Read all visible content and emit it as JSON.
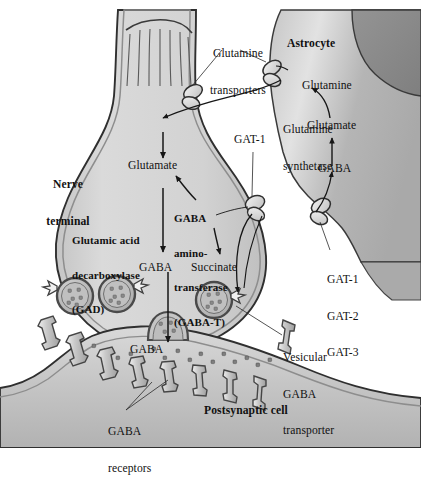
{
  "figure": {
    "domain": "biological-diagram",
    "canvas": {
      "width": 421,
      "height": 448
    },
    "palette": {
      "background": "#ffffff",
      "outline": "#2b2b2b",
      "terminal_fill": "#d4d4d4",
      "terminal_membrane": "#9a9a9a",
      "astrocyte_fill": "#b4b4b4",
      "astrocyte_nucleus": "#8e8e8e",
      "postsynaptic_fill": "#c9c9c9",
      "vesicle_fill": "#b9b9b9",
      "receptor_fill": "#d8d8d8",
      "transporter_fill": "#e3e3e3",
      "cleft_fill": "#c0c0c0",
      "text": "#111111"
    }
  },
  "labels": {
    "glutamine_transporters": {
      "line1": "Glutamine",
      "line2": "transporters"
    },
    "astrocyte": "Astrocyte",
    "nerve_terminal": {
      "line1": "Nerve",
      "line2": "terminal"
    },
    "glutamate_terminal": "Glutamate",
    "glutamine_astro": "Glutamine",
    "glutamine_synthetase": {
      "line1": "Glutamine",
      "line2": "synthetase"
    },
    "glutamate_astro": "Glutamate",
    "gaba_astro": "GABA",
    "gat1_cleft": "GAT-1",
    "gad": {
      "line1": "Glutamic acid",
      "line2": "decarboxylase",
      "line3": "(GAD)"
    },
    "gaba_t": {
      "line1": "GABA",
      "line2": "amino-",
      "line3": "transferase",
      "line4": "(GABA-T)"
    },
    "gaba_cytosol": "GABA",
    "succinate": "Succinate",
    "gaba_cleft": "GABA",
    "gat_family": {
      "line1": "GAT-1",
      "line2": "GAT-2",
      "line3": "GAT-3"
    },
    "vesicular_gaba_transporter": {
      "line1": "Vesicular",
      "line2": "GABA",
      "line3": "transporter"
    },
    "gaba_receptors": {
      "line1": "GABA",
      "line2": "receptors"
    },
    "postsynaptic_cell": "Postsynaptic cell"
  },
  "structures": [
    {
      "name": "presynaptic-nerve-terminal",
      "description": "Large bulbous axon terminal, light grey, striated cytoskeleton at top"
    },
    {
      "name": "astrocyte",
      "description": "Mid-grey glial cell at upper right with darker nucleus"
    },
    {
      "name": "postsynaptic-cell",
      "description": "Grey cell below the terminal bearing GABA receptors"
    },
    {
      "name": "synaptic-cleft",
      "description": "Narrow space containing released GABA molecules"
    },
    {
      "name": "synaptic-vesicles",
      "count": 4,
      "description": "Round vesicles filled with GABA; one is fused to the membrane"
    },
    {
      "name": "glutamine-transporter-astrocyte",
      "count": 1
    },
    {
      "name": "glutamine-transporter-terminal",
      "count": 1
    },
    {
      "name": "gat1-transporter-terminal",
      "count": 1
    },
    {
      "name": "gat-transporter-astrocyte",
      "count": 1
    },
    {
      "name": "vesicular-gaba-transporters",
      "count": 4
    },
    {
      "name": "gaba-receptors",
      "count": 9
    }
  ],
  "pathways": [
    {
      "from": "Glutamine (astrocyte)",
      "to": "Glutamine transporters",
      "to2": "Nerve terminal"
    },
    {
      "from": "Glutamine",
      "to": "Glutamate",
      "enzyme": "glutaminase",
      "location": "nerve terminal"
    },
    {
      "from": "Glutamate",
      "to": "GABA",
      "enzyme": "Glutamic acid decarboxylase (GAD)"
    },
    {
      "from": "GABA",
      "to": "Succinate",
      "enzyme": "GABA aminotransferase (GABA-T)"
    },
    {
      "from": "GABA",
      "to": "synaptic vesicle",
      "transporter": "Vesicular GABA transporter"
    },
    {
      "from": "vesicle",
      "to": "synaptic cleft",
      "process": "exocytosis"
    },
    {
      "from": "synaptic cleft GABA",
      "to": "nerve terminal",
      "transporter": "GAT-1"
    },
    {
      "from": "synaptic cleft GABA",
      "to": "astrocyte",
      "transporter": "GAT-1 / GAT-2 / GAT-3"
    },
    {
      "from": "GABA (astrocyte)",
      "to": "Glutamate",
      "enzyme": "GABA-T"
    },
    {
      "from": "Glutamate (astrocyte)",
      "to": "Glutamine",
      "enzyme": "Glutamine synthetase"
    }
  ]
}
